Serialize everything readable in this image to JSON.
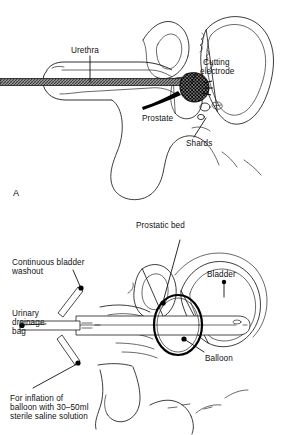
{
  "figure": {
    "background_color": "#ffffff",
    "ink_color": "#1a1a1a",
    "width_px": 282,
    "height_px": 435
  },
  "panel_a": {
    "panel_letter": "A",
    "caption": "Resectoscope in urethra with cutting electrode at the prostate",
    "labels": {
      "urethra": "Urethra",
      "cutting_electrode_line1": "Cutting",
      "cutting_electrode_line2": "electrode",
      "prostate": "Prostate",
      "shards": "Shards"
    },
    "structures": [
      {
        "name": "resectoscope-shaft",
        "style": "hatched-grey-band"
      },
      {
        "name": "penis-outline",
        "style": "line-drawing"
      },
      {
        "name": "prostate-gland",
        "style": "line-drawing"
      },
      {
        "name": "bladder-outline",
        "style": "line-drawing"
      },
      {
        "name": "cutting-electrode",
        "style": "cross-hatched-mass"
      },
      {
        "name": "shards",
        "style": "small-outlined-fragments"
      }
    ]
  },
  "panel_b": {
    "panel_letter": "",
    "caption": "Three-way catheter in situ after resection with balloon inflated in prostatic bed",
    "labels": {
      "prostatic_bed": "Prostatic bed",
      "bladder": "Bladder",
      "balloon": "Balloon",
      "continuous_bladder_washout_line1": "Continuous bladder",
      "continuous_bladder_washout_line2": "washout",
      "urinary_drainage_bag_line1": "Urinary",
      "urinary_drainage_bag_line2": "drainage",
      "urinary_drainage_bag_line3": "bag",
      "inflation_note_line1": "For inflation of",
      "inflation_note_line2": "balloon with 30–50ml",
      "inflation_note_line3": "sterile saline solution"
    },
    "structures": [
      {
        "name": "three-way-catheter",
        "style": "double-line-tube"
      },
      {
        "name": "catheter-y-junction",
        "style": "three-limb-junction"
      },
      {
        "name": "balloon",
        "style": "thick-black-ellipse"
      },
      {
        "name": "bladder-outline",
        "style": "line-drawing"
      },
      {
        "name": "prostatic-bed",
        "style": "line-drawing"
      },
      {
        "name": "pelvic-outline",
        "style": "line-drawing"
      }
    ]
  }
}
